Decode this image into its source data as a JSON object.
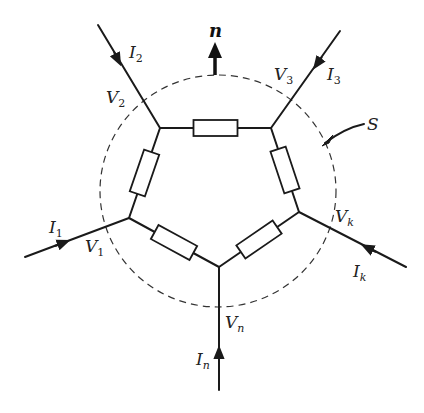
{
  "diagram": {
    "title": "",
    "surface_label": "S",
    "normal_label": "n",
    "nodes": [
      {
        "id": "V1",
        "main": "V",
        "sub": "1",
        "sub_italic": false
      },
      {
        "id": "V2",
        "main": "V",
        "sub": "2",
        "sub_italic": false
      },
      {
        "id": "V3",
        "main": "V",
        "sub": "3",
        "sub_italic": false
      },
      {
        "id": "Vk",
        "main": "V",
        "sub": "k",
        "sub_italic": true
      },
      {
        "id": "Vn",
        "main": "V",
        "sub": "n",
        "sub_italic": true
      }
    ],
    "currents": [
      {
        "id": "I1",
        "main": "I",
        "sub": "1",
        "sub_italic": false,
        "direction": "into-node"
      },
      {
        "id": "I2",
        "main": "I",
        "sub": "2",
        "sub_italic": false,
        "direction": "into-node"
      },
      {
        "id": "I3",
        "main": "I",
        "sub": "3",
        "sub_italic": false,
        "direction": "into-node"
      },
      {
        "id": "Ik",
        "main": "I",
        "sub": "k",
        "sub_italic": true,
        "direction": "into-node"
      },
      {
        "id": "In",
        "main": "I",
        "sub": "n",
        "sub_italic": true,
        "direction": "into-node"
      }
    ],
    "resistor_count": 5,
    "colors": {
      "line": "#1a1a1a",
      "background": "#ffffff"
    }
  }
}
